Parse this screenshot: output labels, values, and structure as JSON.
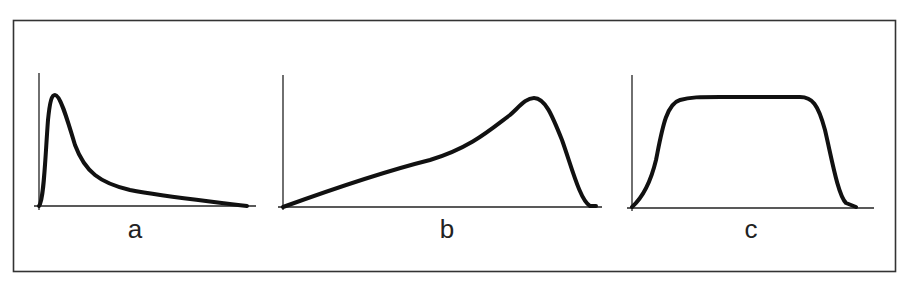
{
  "figure": {
    "panels": [
      {
        "id": "a",
        "label": "a",
        "description": "Sharp early peak with long right-skewed tail"
      },
      {
        "id": "b",
        "label": "b",
        "description": "Gradual linear rise to a late peak followed by a steep drop"
      },
      {
        "id": "c",
        "label": "c",
        "description": "Rapid rise to a flat plateau followed by a rapid fall"
      }
    ],
    "colors": {
      "line": "#111111",
      "axis": "#222222",
      "frame": "#333333",
      "background": "#ffffff"
    }
  }
}
